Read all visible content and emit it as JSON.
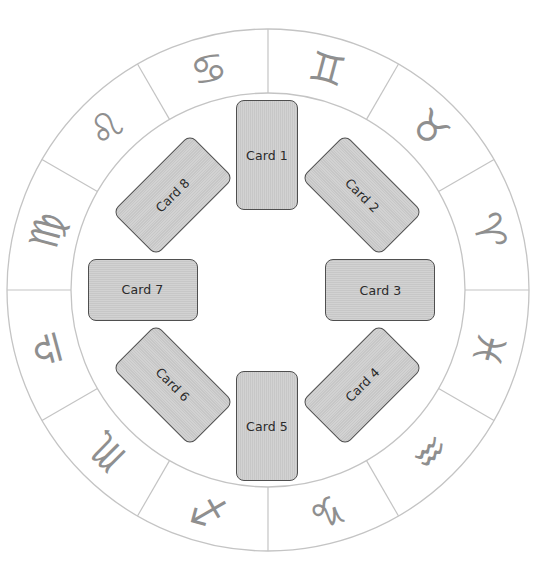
{
  "diagram": {
    "type": "tarot-zodiac-spread",
    "caption_cropped": "",
    "colors": {
      "background": "#ffffff",
      "ring_stroke": "#c4c4c4",
      "glyph_color": "#8f8f8f",
      "card_fill": "#cdcdcd",
      "card_border": "#4f4f4f",
      "card_text": "#2a2a2a"
    },
    "wheel": {
      "center": [
        268,
        290
      ],
      "outer_radius": 261,
      "inner_radius": 197,
      "divisions": 12
    },
    "zodiac_signs": [
      {
        "name": "Gemini",
        "glyph": "♊",
        "angle_deg": 15
      },
      {
        "name": "Taurus",
        "glyph": "♉",
        "angle_deg": 45
      },
      {
        "name": "Aries",
        "glyph": "♈",
        "angle_deg": 75
      },
      {
        "name": "Pisces",
        "glyph": "♓",
        "angle_deg": 105
      },
      {
        "name": "Aquarius",
        "glyph": "♒",
        "angle_deg": 135
      },
      {
        "name": "Capricorn",
        "glyph": "♑",
        "angle_deg": 165
      },
      {
        "name": "Sagittarius",
        "glyph": "♐",
        "angle_deg": 195
      },
      {
        "name": "Scorpio",
        "glyph": "♏",
        "angle_deg": 225
      },
      {
        "name": "Libra",
        "glyph": "♎",
        "angle_deg": 255
      },
      {
        "name": "Virgo",
        "glyph": "♍",
        "angle_deg": 285
      },
      {
        "name": "Leo",
        "glyph": "♌",
        "angle_deg": 315
      },
      {
        "name": "Cancer",
        "glyph": "♋",
        "angle_deg": 345
      }
    ],
    "cards": [
      {
        "label": "Card 1",
        "cx": 267,
        "cy": 155,
        "rotate": 0
      },
      {
        "label": "Card 2",
        "cx": 362,
        "cy": 195,
        "rotate": -45
      },
      {
        "label": "Card 3",
        "cx": 380,
        "cy": 290,
        "rotate": -90
      },
      {
        "label": "Card 4",
        "cx": 362,
        "cy": 385,
        "rotate": -135
      },
      {
        "label": "Card 5",
        "cx": 267,
        "cy": 426,
        "rotate": 0
      },
      {
        "label": "Card 6",
        "cx": 173,
        "cy": 385,
        "rotate": 135
      },
      {
        "label": "Card 7",
        "cx": 143,
        "cy": 290,
        "rotate": 90
      },
      {
        "label": "Card 8",
        "cx": 173,
        "cy": 195,
        "rotate": 45
      }
    ]
  }
}
